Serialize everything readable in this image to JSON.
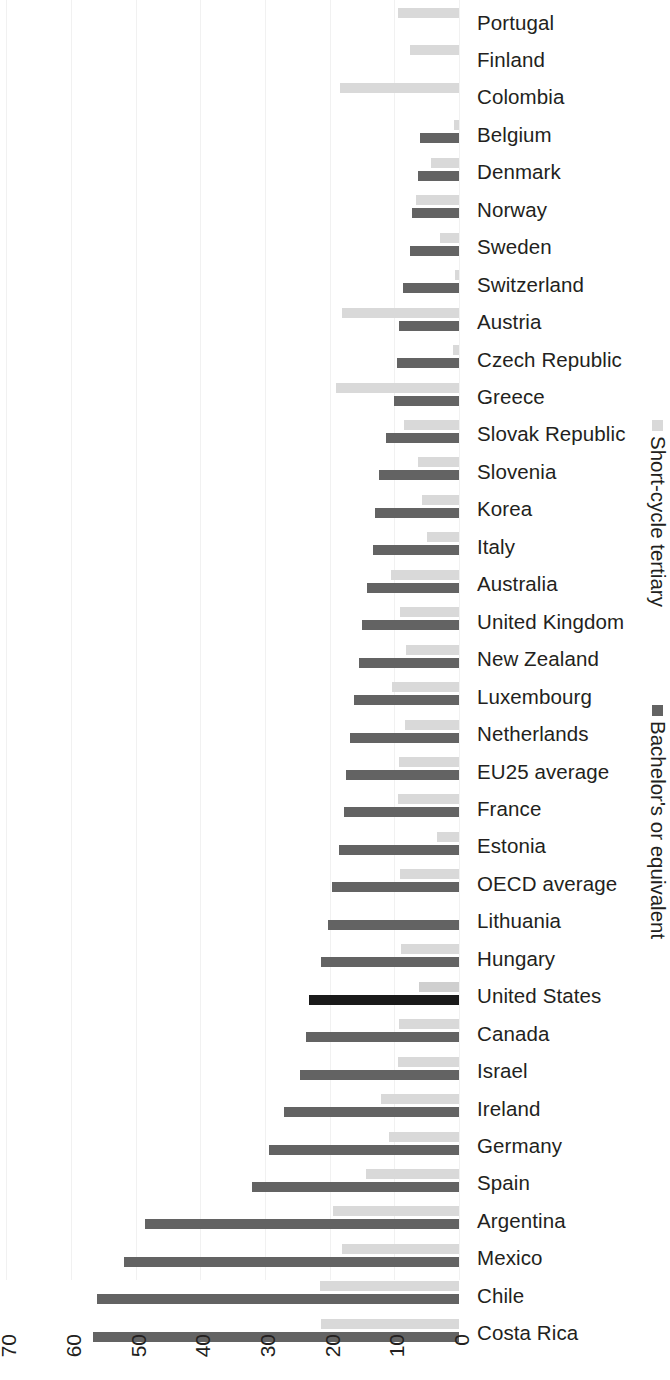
{
  "chart_data": {
    "type": "bar",
    "orientation": "horizontal",
    "title": "",
    "xlabel": "",
    "ylabel": "",
    "xlim": [
      0,
      70
    ],
    "x_ticks": [
      70,
      60,
      50,
      40,
      30,
      20,
      10,
      0
    ],
    "x_axis_reversed": true,
    "grid": true,
    "legend_position": "right",
    "series": [
      {
        "name": "Short-cycle tertiary",
        "color": "#d9d9d9",
        "values": [
          9.4,
          7.6,
          18.4,
          0.8,
          4.3,
          6.6,
          3.0,
          0.6,
          18.1,
          1.0,
          19.0,
          8.5,
          6.4,
          5.7,
          5.0,
          10.5,
          9.1,
          8.2,
          10.4,
          8.3,
          9.3,
          9.4,
          3.4,
          9.1,
          0.0,
          8.9,
          6.2,
          9.2,
          9.4,
          12.0,
          10.8,
          14.4,
          19.5,
          18.1,
          21.5,
          21.3
        ]
      },
      {
        "name": "Bachelor's or equivalent",
        "color": "#636363",
        "values": [
          0.0,
          0.0,
          0.0,
          6.0,
          6.3,
          7.3,
          7.5,
          8.7,
          9.2,
          9.6,
          10.0,
          11.3,
          12.4,
          13.0,
          13.3,
          14.2,
          15.0,
          15.5,
          16.3,
          16.8,
          17.4,
          17.8,
          18.6,
          19.6,
          20.3,
          21.3,
          23.2,
          23.6,
          24.6,
          27.1,
          29.3,
          32.0,
          48.5,
          51.8,
          56.0,
          56.6
        ]
      }
    ],
    "categories": [
      "Portugal",
      "Finland",
      "Colombia",
      "Belgium",
      "Denmark",
      "Norway",
      "Sweden",
      "Switzerland",
      "Austria",
      "Czech Republic",
      "Greece",
      "Slovak Republic",
      "Slovenia",
      "Korea",
      "Italy",
      "Australia",
      "United Kingdom",
      "New Zealand",
      "Luxembourg",
      "Netherlands",
      "EU25 average",
      "France",
      "Estonia",
      "OECD average",
      "Lithuania",
      "Hungary",
      "United States",
      "Canada",
      "Israel",
      "Ireland",
      "Germany",
      "Spain",
      "Argentina",
      "Mexico",
      "Chile",
      "Costa Rica"
    ],
    "highlighted_category": "United States",
    "highlight_color": "#1a1a1a"
  },
  "rows": [
    {
      "country": "Portugal",
      "short": 9.4,
      "bachelor": 0.0
    },
    {
      "country": "Finland",
      "short": 7.6,
      "bachelor": 0.0
    },
    {
      "country": "Colombia",
      "short": 18.4,
      "bachelor": 0.0
    },
    {
      "country": "Belgium",
      "short": 0.8,
      "bachelor": 6.0
    },
    {
      "country": "Denmark",
      "short": 4.3,
      "bachelor": 6.3
    },
    {
      "country": "Norway",
      "short": 6.6,
      "bachelor": 7.3
    },
    {
      "country": "Sweden",
      "short": 3.0,
      "bachelor": 7.5
    },
    {
      "country": "Switzerland",
      "short": 0.6,
      "bachelor": 8.7
    },
    {
      "country": "Austria",
      "short": 18.1,
      "bachelor": 9.2
    },
    {
      "country": "Czech Republic",
      "short": 1.0,
      "bachelor": 9.6
    },
    {
      "country": "Greece",
      "short": 19.0,
      "bachelor": 10.0
    },
    {
      "country": "Slovak Republic",
      "short": 8.5,
      "bachelor": 11.3
    },
    {
      "country": "Slovenia",
      "short": 6.4,
      "bachelor": 12.4
    },
    {
      "country": "Korea",
      "short": 5.7,
      "bachelor": 13.0
    },
    {
      "country": "Italy",
      "short": 5.0,
      "bachelor": 13.3
    },
    {
      "country": "Australia",
      "short": 10.5,
      "bachelor": 14.2
    },
    {
      "country": "United Kingdom",
      "short": 9.1,
      "bachelor": 15.0
    },
    {
      "country": "New Zealand",
      "short": 8.2,
      "bachelor": 15.5
    },
    {
      "country": "Luxembourg",
      "short": 10.4,
      "bachelor": 16.3
    },
    {
      "country": "Netherlands",
      "short": 8.3,
      "bachelor": 16.8
    },
    {
      "country": "EU25 average",
      "short": 9.3,
      "bachelor": 17.4
    },
    {
      "country": "France",
      "short": 9.4,
      "bachelor": 17.8
    },
    {
      "country": "Estonia",
      "short": 3.4,
      "bachelor": 18.6
    },
    {
      "country": "OECD average",
      "short": 9.1,
      "bachelor": 19.6
    },
    {
      "country": "Lithuania",
      "short": 0.0,
      "bachelor": 20.3
    },
    {
      "country": "Hungary",
      "short": 8.9,
      "bachelor": 21.3
    },
    {
      "country": "United States",
      "short": 6.2,
      "bachelor": 23.2
    },
    {
      "country": "Canada",
      "short": 9.2,
      "bachelor": 23.6
    },
    {
      "country": "Israel",
      "short": 9.4,
      "bachelor": 24.6
    },
    {
      "country": "Ireland",
      "short": 12.0,
      "bachelor": 27.1
    },
    {
      "country": "Germany",
      "short": 10.8,
      "bachelor": 29.3
    },
    {
      "country": "Spain",
      "short": 14.4,
      "bachelor": 32.0
    },
    {
      "country": "Argentina",
      "short": 19.5,
      "bachelor": 48.5
    },
    {
      "country": "Mexico",
      "short": 18.1,
      "bachelor": 51.8
    },
    {
      "country": "Chile",
      "short": 21.5,
      "bachelor": 56.0
    },
    {
      "country": "Costa Rica",
      "short": 21.3,
      "bachelor": 56.6
    }
  ],
  "axis": {
    "ticks": [
      "70",
      "60",
      "50",
      "40",
      "30",
      "20",
      "10",
      "0"
    ]
  },
  "legend": {
    "short_cycle_label": "Short-cycle tertiary",
    "bachelor_label": "Bachelor's or equivalent",
    "short_cycle_color": "#d9d9d9",
    "bachelor_color": "#636363"
  },
  "colors": {
    "short_cycle": "#d9d9d9",
    "bachelor": "#636363",
    "highlight": "#1a1a1a",
    "text": "#231f20",
    "grid": "#f1f1f1",
    "background": "#ffffff"
  }
}
